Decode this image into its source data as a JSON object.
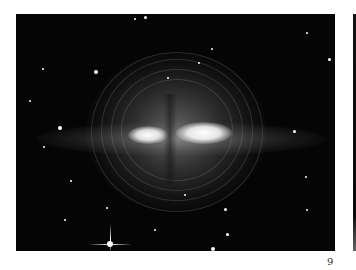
{
  "page": {
    "number": "9"
  },
  "adjacent_figure": {
    "description": "Edge of a second dark photograph at right margin"
  }
}
